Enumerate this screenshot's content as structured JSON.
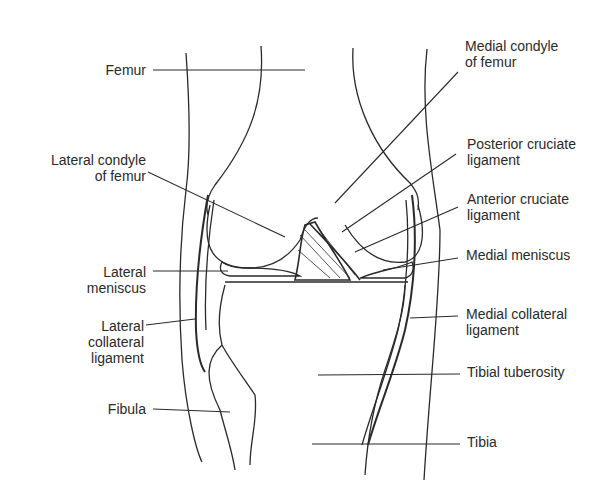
{
  "diagram": {
    "labels_left": [
      {
        "id": "femur",
        "text": "Femur"
      },
      {
        "id": "lateral-condyle",
        "text": "Lateral condyle\nof femur"
      },
      {
        "id": "lateral-meniscus",
        "text": "Lateral\nmeniscus"
      },
      {
        "id": "lateral-collateral",
        "text": "Lateral\ncollateral\nligament"
      },
      {
        "id": "fibula",
        "text": "Fibula"
      }
    ],
    "labels_right": [
      {
        "id": "medial-condyle",
        "text": "Medial condyle\nof femur"
      },
      {
        "id": "posterior-cruciate",
        "text": "Posterior cruciate\nligament"
      },
      {
        "id": "anterior-cruciate",
        "text": "Anterior cruciate\nligament"
      },
      {
        "id": "medial-meniscus",
        "text": "Medial meniscus"
      },
      {
        "id": "medial-collateral",
        "text": "Medial collateral\nligament"
      },
      {
        "id": "tibial-tuberosity",
        "text": "Tibial tuberosity"
      },
      {
        "id": "tibia",
        "text": "Tibia"
      }
    ],
    "colors": {
      "line": "#2a2a2a",
      "background": "#ffffff"
    }
  }
}
